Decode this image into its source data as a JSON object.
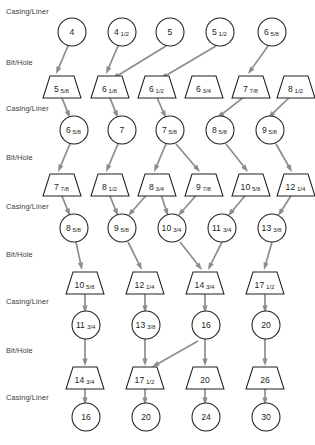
{
  "diagram": {
    "row_labels": {
      "casing": "Casing/Liner",
      "bit": "Bit/Hole"
    },
    "rows": [
      {
        "type": "casing",
        "label": "Casing/Liner",
        "label_y": 14,
        "shape": "circle",
        "y": 32,
        "nodes": [
          {
            "id": "c1-0",
            "x": 72,
            "whole": "4",
            "frac": ""
          },
          {
            "id": "c1-1",
            "x": 122,
            "whole": "4",
            "frac": "1/2"
          },
          {
            "id": "c1-2",
            "x": 170,
            "whole": "5",
            "frac": ""
          },
          {
            "id": "c1-3",
            "x": 220,
            "whole": "5",
            "frac": "1/2"
          },
          {
            "id": "c1-4",
            "x": 272,
            "whole": "6",
            "frac": "5/8"
          }
        ]
      },
      {
        "type": "bit",
        "label": "Bit/Hole",
        "label_y": 65,
        "shape": "trapezoid",
        "y": 87,
        "nodes": [
          {
            "id": "b1-0",
            "x": 62,
            "whole": "5",
            "frac": "5/8"
          },
          {
            "id": "b1-1",
            "x": 110,
            "whole": "6",
            "frac": "1/8"
          },
          {
            "id": "b1-2",
            "x": 157,
            "whole": "6",
            "frac": "1/2"
          },
          {
            "id": "b1-3",
            "x": 204,
            "whole": "6",
            "frac": "3/4"
          },
          {
            "id": "b1-4",
            "x": 251,
            "whole": "7",
            "frac": "7/8"
          },
          {
            "id": "b1-5",
            "x": 296,
            "whole": "8",
            "frac": "1/2"
          }
        ]
      },
      {
        "type": "casing",
        "label": "Casing/Liner",
        "label_y": 111,
        "shape": "circle",
        "y": 130,
        "nodes": [
          {
            "id": "c2-0",
            "x": 74,
            "whole": "6",
            "frac": "5/8"
          },
          {
            "id": "c2-1",
            "x": 122,
            "whole": "7",
            "frac": ""
          },
          {
            "id": "c2-2",
            "x": 170,
            "whole": "7",
            "frac": "5/8"
          },
          {
            "id": "c2-3",
            "x": 220,
            "whole": "8",
            "frac": "5/8"
          },
          {
            "id": "c2-4",
            "x": 270,
            "whole": "9",
            "frac": "5/8"
          }
        ]
      },
      {
        "type": "bit",
        "label": "Bit/Hole",
        "label_y": 160,
        "shape": "trapezoid",
        "y": 185,
        "nodes": [
          {
            "id": "b2-0",
            "x": 62,
            "whole": "7",
            "frac": "7/8"
          },
          {
            "id": "b2-1",
            "x": 110,
            "whole": "8",
            "frac": "1/2"
          },
          {
            "id": "b2-2",
            "x": 157,
            "whole": "8",
            "frac": "3/4"
          },
          {
            "id": "b2-3",
            "x": 204,
            "whole": "9",
            "frac": "7/8"
          },
          {
            "id": "b2-4",
            "x": 251,
            "whole": "10",
            "frac": "5/8"
          },
          {
            "id": "b2-5",
            "x": 296,
            "whole": "12",
            "frac": "1/4"
          }
        ]
      },
      {
        "type": "casing",
        "label": "Casing/Liner",
        "label_y": 209,
        "shape": "circle",
        "y": 228,
        "nodes": [
          {
            "id": "c3-0",
            "x": 74,
            "whole": "8",
            "frac": "5/8"
          },
          {
            "id": "c3-1",
            "x": 122,
            "whole": "9",
            "frac": "5/8"
          },
          {
            "id": "c3-2",
            "x": 172,
            "whole": "10",
            "frac": "3/4"
          },
          {
            "id": "c3-3",
            "x": 222,
            "whole": "11",
            "frac": "3/4"
          },
          {
            "id": "c3-4",
            "x": 272,
            "whole": "13",
            "frac": "3/8"
          }
        ]
      },
      {
        "type": "bit",
        "label": "Bit/Hole",
        "label_y": 257,
        "shape": "trapezoid",
        "y": 283,
        "nodes": [
          {
            "id": "b3-0",
            "x": 85,
            "whole": "10",
            "frac": "5/8"
          },
          {
            "id": "b3-1",
            "x": 145,
            "whole": "12",
            "frac": "1/4"
          },
          {
            "id": "b3-2",
            "x": 205,
            "whole": "14",
            "frac": "3/4"
          },
          {
            "id": "b3-3",
            "x": 265,
            "whole": "17",
            "frac": "1/2"
          }
        ]
      },
      {
        "type": "casing",
        "label": "Casing/Liner",
        "label_y": 304,
        "shape": "circle",
        "y": 325,
        "nodes": [
          {
            "id": "c4-0",
            "x": 86,
            "whole": "11",
            "frac": "3/4"
          },
          {
            "id": "c4-1",
            "x": 146,
            "whole": "13",
            "frac": "3/8"
          },
          {
            "id": "c4-2",
            "x": 206,
            "whole": "16",
            "frac": ""
          },
          {
            "id": "c4-3",
            "x": 266,
            "whole": "20",
            "frac": ""
          }
        ]
      },
      {
        "type": "bit",
        "label": "Bit/Hole",
        "label_y": 353,
        "shape": "trapezoid",
        "y": 378,
        "nodes": [
          {
            "id": "b4-0",
            "x": 85,
            "whole": "14",
            "frac": "3/4"
          },
          {
            "id": "b4-1",
            "x": 145,
            "whole": "17",
            "frac": "1/2"
          },
          {
            "id": "b4-2",
            "x": 205,
            "whole": "20",
            "frac": ""
          },
          {
            "id": "b4-3",
            "x": 265,
            "whole": "26",
            "frac": ""
          }
        ]
      },
      {
        "type": "casing",
        "label": "Casing/Liner",
        "label_y": 400,
        "shape": "circle",
        "y": 417,
        "nodes": [
          {
            "id": "c5-0",
            "x": 86,
            "whole": "16",
            "frac": ""
          },
          {
            "id": "c5-1",
            "x": 146,
            "whole": "20",
            "frac": ""
          },
          {
            "id": "c5-2",
            "x": 206,
            "whole": "24",
            "frac": ""
          },
          {
            "id": "c5-3",
            "x": 266,
            "whole": "30",
            "frac": ""
          }
        ]
      }
    ],
    "edges": [
      {
        "from": "c1-0",
        "to": "b1-0",
        "x1": 68,
        "y1": 46,
        "x2": 56,
        "y2": 74
      },
      {
        "from": "c1-1",
        "to": "b1-1",
        "x1": 118,
        "y1": 46,
        "x2": 106,
        "y2": 74
      },
      {
        "from": "c1-2",
        "to": "b1-1",
        "x1": 166,
        "y1": 46,
        "x2": 112,
        "y2": 79
      },
      {
        "from": "c1-3",
        "to": "b1-2",
        "x1": 216,
        "y1": 46,
        "x2": 160,
        "y2": 79
      },
      {
        "from": "c1-4",
        "to": "b1-4",
        "x1": 268,
        "y1": 46,
        "x2": 248,
        "y2": 74
      },
      {
        "from": "b1-0",
        "to": "c2-0",
        "x1": 60,
        "y1": 93,
        "x2": 70,
        "y2": 118
      },
      {
        "from": "b1-1",
        "to": "c2-1",
        "x1": 108,
        "y1": 93,
        "x2": 118,
        "y2": 118
      },
      {
        "from": "b1-2",
        "to": "c2-2",
        "x1": 155,
        "y1": 93,
        "x2": 166,
        "y2": 118
      },
      {
        "from": "b1-4",
        "to": "c2-3",
        "x1": 249,
        "y1": 93,
        "x2": 217,
        "y2": 118
      },
      {
        "from": "b1-5",
        "to": "c2-4",
        "x1": 294,
        "y1": 93,
        "x2": 268,
        "y2": 118
      },
      {
        "from": "c2-0",
        "to": "b2-0",
        "x1": 70,
        "y1": 144,
        "x2": 58,
        "y2": 172
      },
      {
        "from": "c2-1",
        "to": "b2-1",
        "x1": 118,
        "y1": 144,
        "x2": 106,
        "y2": 172
      },
      {
        "from": "c2-2",
        "to": "b2-2",
        "x1": 166,
        "y1": 144,
        "x2": 154,
        "y2": 172
      },
      {
        "from": "c2-2",
        "to": "b2-3",
        "x1": 176,
        "y1": 144,
        "x2": 200,
        "y2": 172
      },
      {
        "from": "c2-3",
        "to": "b2-4",
        "x1": 226,
        "y1": 144,
        "x2": 248,
        "y2": 172
      },
      {
        "from": "c2-4",
        "to": "b2-5",
        "x1": 276,
        "y1": 144,
        "x2": 292,
        "y2": 172
      },
      {
        "from": "b2-0",
        "to": "c3-0",
        "x1": 60,
        "y1": 191,
        "x2": 70,
        "y2": 216
      },
      {
        "from": "b2-1",
        "to": "c3-1",
        "x1": 108,
        "y1": 191,
        "x2": 118,
        "y2": 216
      },
      {
        "from": "b2-2",
        "to": "c3-1",
        "x1": 150,
        "y1": 191,
        "x2": 128,
        "y2": 216
      },
      {
        "from": "b2-2",
        "to": "c3-2",
        "x1": 160,
        "y1": 191,
        "x2": 168,
        "y2": 216
      },
      {
        "from": "b2-3",
        "to": "c3-2",
        "x1": 200,
        "y1": 191,
        "x2": 178,
        "y2": 216
      },
      {
        "from": "b2-4",
        "to": "c3-3",
        "x1": 249,
        "y1": 191,
        "x2": 228,
        "y2": 216
      },
      {
        "from": "b2-5",
        "to": "c3-4",
        "x1": 294,
        "y1": 191,
        "x2": 278,
        "y2": 216
      },
      {
        "from": "c3-0",
        "to": "b3-0",
        "x1": 76,
        "y1": 242,
        "x2": 82,
        "y2": 270
      },
      {
        "from": "c3-1",
        "to": "b3-1",
        "x1": 128,
        "y1": 242,
        "x2": 142,
        "y2": 270
      },
      {
        "from": "c3-2",
        "to": "b3-2",
        "x1": 180,
        "y1": 242,
        "x2": 202,
        "y2": 270
      },
      {
        "from": "c3-3",
        "to": "b3-2",
        "x1": 222,
        "y1": 242,
        "x2": 208,
        "y2": 270
      },
      {
        "from": "c3-4",
        "to": "b3-3",
        "x1": 272,
        "y1": 242,
        "x2": 264,
        "y2": 270
      },
      {
        "from": "b3-0",
        "to": "c4-0",
        "x1": 85,
        "y1": 290,
        "x2": 85,
        "y2": 313
      },
      {
        "from": "b3-1",
        "to": "c4-1",
        "x1": 145,
        "y1": 290,
        "x2": 145,
        "y2": 313
      },
      {
        "from": "b3-2",
        "to": "c4-2",
        "x1": 205,
        "y1": 290,
        "x2": 205,
        "y2": 313
      },
      {
        "from": "b3-3",
        "to": "c4-3",
        "x1": 265,
        "y1": 290,
        "x2": 265,
        "y2": 313
      },
      {
        "from": "c4-0",
        "to": "b4-0",
        "x1": 85,
        "y1": 339,
        "x2": 85,
        "y2": 366
      },
      {
        "from": "c4-1",
        "to": "b4-1",
        "x1": 145,
        "y1": 339,
        "x2": 145,
        "y2": 366
      },
      {
        "from": "c4-2",
        "to": "b4-1",
        "x1": 198,
        "y1": 341,
        "x2": 152,
        "y2": 367
      },
      {
        "from": "c4-2",
        "to": "b4-2",
        "x1": 205,
        "y1": 339,
        "x2": 205,
        "y2": 366
      },
      {
        "from": "c4-3",
        "to": "b4-3",
        "x1": 265,
        "y1": 339,
        "x2": 265,
        "y2": 366
      },
      {
        "from": "b4-0",
        "to": "c5-0",
        "x1": 85,
        "y1": 385,
        "x2": 85,
        "y2": 405
      },
      {
        "from": "b4-1",
        "to": "c5-1",
        "x1": 145,
        "y1": 385,
        "x2": 145,
        "y2": 405
      },
      {
        "from": "b4-2",
        "to": "c5-2",
        "x1": 205,
        "y1": 385,
        "x2": 205,
        "y2": 405
      },
      {
        "from": "b4-3",
        "to": "c5-3",
        "x1": 265,
        "y1": 385,
        "x2": 265,
        "y2": 405
      }
    ],
    "style": {
      "arrow_color": "#8d8d8d",
      "shape_stroke": "#231f20",
      "shape_fill": "#ffffff",
      "label_color": "#3a3a3a",
      "background": "#ffffff"
    }
  }
}
